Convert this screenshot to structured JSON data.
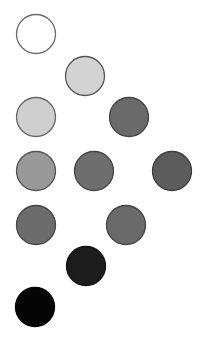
{
  "diagram": {
    "background": "#ffffff",
    "radius": 19.5,
    "stroke": "#4a4a4a",
    "circles": [
      {
        "id": "c1",
        "cx": 36,
        "cy": 34,
        "fill": "#ffffff",
        "stroke": "#6a6a6a"
      },
      {
        "id": "c2",
        "cx": 85,
        "cy": 76,
        "fill": "#d3d3d3",
        "stroke": "#555555"
      },
      {
        "id": "c3",
        "cx": 36,
        "cy": 117,
        "fill": "#cfcfcf",
        "stroke": "#666666"
      },
      {
        "id": "c4",
        "cx": 129,
        "cy": 117,
        "fill": "#6a6a6a",
        "stroke": "#444444"
      },
      {
        "id": "c5",
        "cx": 36,
        "cy": 171,
        "fill": "#999999",
        "stroke": "#555555"
      },
      {
        "id": "c6",
        "cx": 94,
        "cy": 171,
        "fill": "#6e6e6e",
        "stroke": "#444444"
      },
      {
        "id": "c7",
        "cx": 172,
        "cy": 171,
        "fill": "#5c5c5c",
        "stroke": "#3c3c3c"
      },
      {
        "id": "c8",
        "cx": 36,
        "cy": 225,
        "fill": "#6c6c6c",
        "stroke": "#444444"
      },
      {
        "id": "c9",
        "cx": 126,
        "cy": 225,
        "fill": "#6a6a6a",
        "stroke": "#444444"
      },
      {
        "id": "c10",
        "cx": 86,
        "cy": 266,
        "fill": "#1c1c1c",
        "stroke": "#111111"
      },
      {
        "id": "c11",
        "cx": 35,
        "cy": 307,
        "fill": "#050505",
        "stroke": "#000000"
      }
    ]
  }
}
